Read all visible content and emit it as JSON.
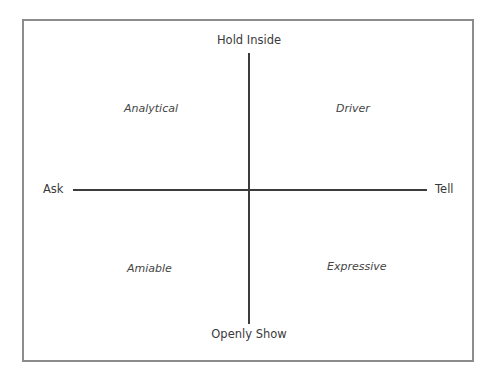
{
  "diagram": {
    "type": "quadrant",
    "axes": {
      "vertical": {
        "top_label": "Hold Inside",
        "bottom_label": "Openly Show"
      },
      "horizontal": {
        "left_label": "Ask",
        "right_label": "Tell"
      }
    },
    "quadrants": {
      "top_left": "Analytical",
      "top_right": "Driver",
      "bottom_left": "Amiable",
      "bottom_right": "Expressive"
    },
    "colors": {
      "border": "#8c8c8c",
      "axis": "#3c3c3c",
      "text": "#3a3a3a"
    }
  }
}
